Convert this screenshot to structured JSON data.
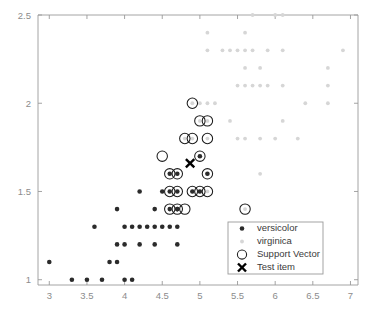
{
  "chart_data": {
    "type": "scatter",
    "title": "",
    "xlabel": "",
    "ylabel": "",
    "xlim": [
      2.85,
      7.1
    ],
    "ylim": [
      0.97,
      2.5
    ],
    "xticks": [
      3,
      3.5,
      4,
      4.5,
      5,
      5.5,
      6,
      6.5,
      7
    ],
    "xticklabels": [
      "3",
      "3.5",
      "4",
      "4.5",
      "5",
      "5.5",
      "6",
      "6.5",
      "7"
    ],
    "yticks": [
      1,
      1.5,
      2,
      2.5
    ],
    "yticklabels": [
      "1",
      "1.5",
      "2",
      "2.5"
    ],
    "grid": false,
    "legend_position": "lower right",
    "colors": {
      "versicolor": "#2b2b2b",
      "virginica": "#d6d6d6",
      "support_vector": "#1c1c1c",
      "test_item": "#000000",
      "axis": "#9a9a9a",
      "tick_text": "#8c8c8c",
      "legend_text": "#3a3a3a",
      "background": "#ffffff"
    },
    "series": [
      {
        "name": "versicolor",
        "marker": "filled-circle",
        "color": "#2b2b2b",
        "points": [
          [
            3.0,
            1.1
          ],
          [
            3.3,
            1.0
          ],
          [
            3.5,
            1.0
          ],
          [
            3.7,
            1.0
          ],
          [
            4.0,
            1.0
          ],
          [
            4.1,
            1.0
          ],
          [
            3.8,
            1.1
          ],
          [
            3.9,
            1.1
          ],
          [
            3.9,
            1.2
          ],
          [
            4.0,
            1.2
          ],
          [
            4.2,
            1.2
          ],
          [
            4.4,
            1.2
          ],
          [
            4.7,
            1.2
          ],
          [
            3.6,
            1.3
          ],
          [
            4.0,
            1.3
          ],
          [
            4.1,
            1.3
          ],
          [
            4.2,
            1.3
          ],
          [
            4.3,
            1.3
          ],
          [
            4.4,
            1.3
          ],
          [
            4.5,
            1.3
          ],
          [
            4.6,
            1.3
          ],
          [
            4.7,
            1.3
          ],
          [
            3.9,
            1.4
          ],
          [
            4.4,
            1.4
          ],
          [
            4.6,
            1.4
          ],
          [
            4.7,
            1.4
          ],
          [
            4.7,
            1.4
          ],
          [
            4.2,
            1.5
          ],
          [
            4.5,
            1.5
          ],
          [
            4.6,
            1.5
          ],
          [
            4.7,
            1.5
          ],
          [
            4.9,
            1.5
          ],
          [
            5.0,
            1.5
          ],
          [
            4.6,
            1.6
          ],
          [
            4.7,
            1.6
          ],
          [
            5.1,
            1.6
          ],
          [
            5.0,
            1.7
          ]
        ]
      },
      {
        "name": "virginica",
        "marker": "small-filled-circle",
        "color": "#d6d6d6",
        "points": [
          [
            5.7,
            2.5
          ],
          [
            6.0,
            2.5
          ],
          [
            6.1,
            2.5
          ],
          [
            5.1,
            2.4
          ],
          [
            5.6,
            2.4
          ],
          [
            5.1,
            2.3
          ],
          [
            5.3,
            2.3
          ],
          [
            5.4,
            2.3
          ],
          [
            5.5,
            2.3
          ],
          [
            5.6,
            2.3
          ],
          [
            5.7,
            2.3
          ],
          [
            5.9,
            2.3
          ],
          [
            6.1,
            2.3
          ],
          [
            6.9,
            2.3
          ],
          [
            5.6,
            2.2
          ],
          [
            5.8,
            2.2
          ],
          [
            6.7,
            2.2
          ],
          [
            5.5,
            2.1
          ],
          [
            5.6,
            2.1
          ],
          [
            5.7,
            2.1
          ],
          [
            5.8,
            2.1
          ],
          [
            5.9,
            2.1
          ],
          [
            6.1,
            2.1
          ],
          [
            6.7,
            2.1
          ],
          [
            4.9,
            2.0
          ],
          [
            5.0,
            2.0
          ],
          [
            5.1,
            2.0
          ],
          [
            5.2,
            2.0
          ],
          [
            6.4,
            2.0
          ],
          [
            6.7,
            2.0
          ],
          [
            5.0,
            1.9
          ],
          [
            5.1,
            1.9
          ],
          [
            5.4,
            1.9
          ],
          [
            6.1,
            1.9
          ],
          [
            4.8,
            1.8
          ],
          [
            4.9,
            1.8
          ],
          [
            5.1,
            1.8
          ],
          [
            5.5,
            1.8
          ],
          [
            5.6,
            1.8
          ],
          [
            5.8,
            1.8
          ],
          [
            6.0,
            1.8
          ],
          [
            6.3,
            1.8
          ],
          [
            5.0,
            1.7
          ],
          [
            5.1,
            1.6
          ],
          [
            5.8,
            1.6
          ],
          [
            4.9,
            1.5
          ],
          [
            5.0,
            1.5
          ],
          [
            5.1,
            1.5
          ],
          [
            5.6,
            1.4
          ]
        ]
      }
    ],
    "support_vectors": {
      "name": "Support Vector",
      "marker": "open-circle",
      "color": "#1c1c1c",
      "points": [
        [
          4.9,
          2.0
        ],
        [
          5.0,
          1.9
        ],
        [
          5.1,
          1.9
        ],
        [
          4.8,
          1.8
        ],
        [
          4.9,
          1.8
        ],
        [
          5.1,
          1.8
        ],
        [
          4.5,
          1.7
        ],
        [
          5.0,
          1.7
        ],
        [
          4.6,
          1.6
        ],
        [
          4.7,
          1.6
        ],
        [
          5.1,
          1.6
        ],
        [
          4.6,
          1.5
        ],
        [
          4.7,
          1.5
        ],
        [
          4.9,
          1.5
        ],
        [
          5.0,
          1.5
        ],
        [
          5.1,
          1.5
        ],
        [
          4.6,
          1.4
        ],
        [
          4.7,
          1.4
        ],
        [
          4.8,
          1.4
        ],
        [
          5.6,
          1.4
        ]
      ]
    },
    "test_item": {
      "name": "Test item",
      "marker": "x",
      "color": "#000000",
      "point": [
        4.87,
        1.66
      ]
    },
    "legend": {
      "entries": [
        {
          "label": "versicolor",
          "marker": "filled-circle",
          "color": "#2b2b2b"
        },
        {
          "label": "virginica",
          "marker": "small-filled-circle",
          "color": "#d6d6d6"
        },
        {
          "label": "Support Vector",
          "marker": "open-circle",
          "color": "#1c1c1c"
        },
        {
          "label": "Test item",
          "marker": "x",
          "color": "#000000"
        }
      ]
    }
  }
}
